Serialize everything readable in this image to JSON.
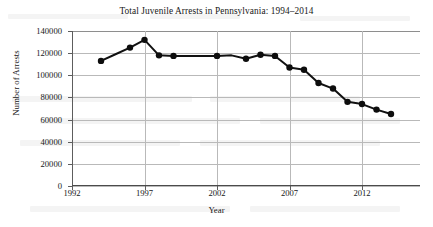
{
  "chart_data": {
    "type": "line",
    "title": "Total Juvenile Arrests in Pennsylvania: 1994–2014",
    "xlabel": "Year",
    "ylabel": "Number of Arrests",
    "grid": true,
    "legend": "none",
    "xlim": [
      1992,
      2016
    ],
    "ylim": [
      0,
      140000
    ],
    "xticks": [
      1992,
      1997,
      2002,
      2007,
      2012
    ],
    "yticks": [
      0,
      20000,
      40000,
      60000,
      80000,
      100000,
      120000,
      140000
    ],
    "xtick_labels": [
      "1992",
      "1997",
      "2002",
      "2007",
      "2012"
    ],
    "ytick_labels": [
      "0",
      "20000",
      "40000",
      "60000",
      "80000",
      "100000",
      "120000",
      "140000"
    ],
    "series": [
      {
        "name": "Total Juvenile Arrests",
        "x": [
          1994,
          1995,
          1996,
          1997,
          1998,
          1999,
          2000,
          2001,
          2002,
          2003,
          2004,
          2005,
          2006,
          2007,
          2008,
          2009,
          2010,
          2011,
          2012,
          2013,
          2014
        ],
        "values": [
          113000,
          119000,
          125000,
          132000,
          118000,
          117500,
          117500,
          117500,
          117500,
          118000,
          115000,
          118500,
          117500,
          107000,
          105000,
          93000,
          88000,
          76000,
          74000,
          69000,
          65000
        ]
      }
    ]
  }
}
